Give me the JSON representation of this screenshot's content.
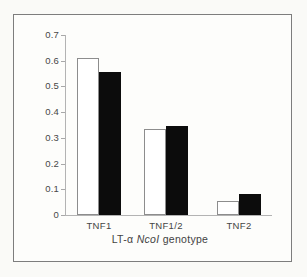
{
  "figure": {
    "page_background": "#fafaf7",
    "frame_background": "#fdfdfb",
    "frame_border_color": "#7d7d7d",
    "axis_color": "#b3b3b3",
    "text_color": "#454545",
    "open_bar_fill": "#ffffff",
    "open_bar_border": "#8d8d8d",
    "solid_bar_fill": "#0c0c0c"
  },
  "chart_data": {
    "type": "bar",
    "title": "",
    "xlabel": "LT-α NcoI genotype",
    "xlabel_parts": [
      {
        "text": "LT-α ",
        "italic": false
      },
      {
        "text": "NcoI",
        "italic": true
      },
      {
        "text": " genotype",
        "italic": false
      }
    ],
    "ylabel": "",
    "categories": [
      "TNF1",
      "TNF1/2",
      "TNF2"
    ],
    "series": [
      {
        "name": "open-bars",
        "style": "open",
        "fill": "#ffffff",
        "values": [
          0.61,
          0.335,
          0.055
        ]
      },
      {
        "name": "solid-bars",
        "style": "solid",
        "fill": "#0c0c0c",
        "values": [
          0.555,
          0.345,
          0.08
        ]
      }
    ],
    "ylim": [
      0,
      0.7
    ],
    "ytick_step": 0.1,
    "ytick_labels": [
      "0",
      "0.1",
      "0.2",
      "0.3",
      "0.4",
      "0.5",
      "0.6",
      "0.7"
    ],
    "grid": false,
    "legend": "none"
  }
}
